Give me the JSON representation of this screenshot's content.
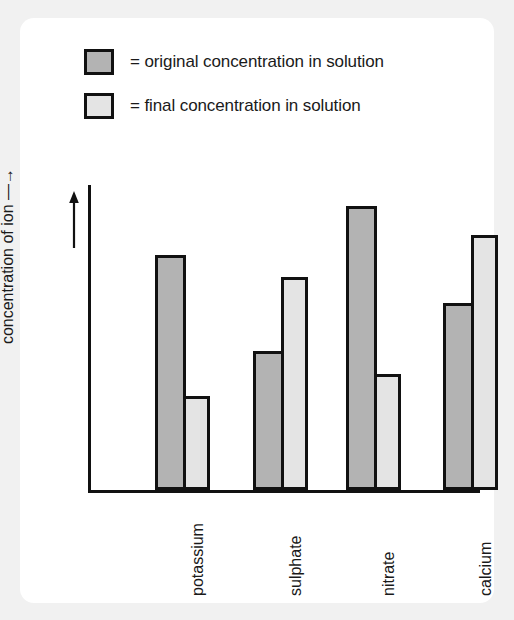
{
  "figure": {
    "background_color": "#f1f1f1",
    "card_color": "#ffffff"
  },
  "legend": {
    "position": "top-left",
    "items": [
      {
        "key": "original",
        "swatch_color": "#b3b3b3",
        "label": "= original concentration in solution"
      },
      {
        "key": "final",
        "swatch_color": "#e4e4e4",
        "label": "= final concentration in solution"
      }
    ]
  },
  "axes": {
    "y_label_line1": "increasing relative",
    "y_label_line2": "concentration of ion —→",
    "y_label_arrow_icon": "up-arrow-icon",
    "x_label": ""
  },
  "chart_data": {
    "type": "bar",
    "title": "",
    "subtitle": "",
    "xlabel": "",
    "ylabel": "increasing relative concentration of ion",
    "categories": [
      "potassium",
      "sulphate",
      "nitrate",
      "calcium"
    ],
    "series": [
      {
        "name": "original concentration in solution",
        "color": "#b3b3b3",
        "values": [
          83,
          49,
          100,
          66
        ]
      },
      {
        "name": "final concentration in solution",
        "color": "#e4e4e4",
        "values": [
          33,
          75,
          41,
          90
        ]
      }
    ],
    "ylim": [
      0,
      110
    ],
    "y_ticks": [],
    "grid": false,
    "legend_position": "above-plot",
    "units": "relative (unlabelled axis)"
  }
}
